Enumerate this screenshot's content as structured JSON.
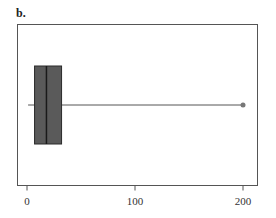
{
  "panel_label": "b.",
  "chart_data": {
    "type": "boxplot",
    "orientation": "horizontal",
    "title": "",
    "xlabel": "",
    "ylabel": "",
    "xlim": [
      -9,
      213
    ],
    "x_ticks": [
      0,
      100,
      200
    ],
    "x_tick_labels": [
      "0",
      "100",
      "200"
    ],
    "grid": false,
    "legend": null,
    "series": [
      {
        "name": "b",
        "whisker_low": 1,
        "q1": 7,
        "median": 18,
        "q3": 32,
        "whisker_high": 200,
        "outliers": [
          200
        ]
      }
    ],
    "colors": {
      "box_fill": "#5a5a5a",
      "box_edge": "#2a2a2a",
      "whisker": "#555555",
      "outlier": "#777777",
      "frame": "#555555"
    }
  }
}
